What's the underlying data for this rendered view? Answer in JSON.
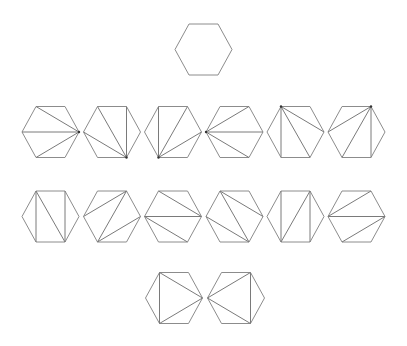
{
  "figure": {
    "stroke_color": "#8c8c8c",
    "diagonal_color": "#7a7a7a",
    "background": "#ffffff"
  },
  "hexagon_shape": {
    "half_width": 28.5,
    "top_half_width": 14.5,
    "half_height": 25.5,
    "vertex_order": [
      "TL",
      "TR",
      "R",
      "BR",
      "BL",
      "L"
    ]
  },
  "rows": [
    {
      "name": "original-hexagon",
      "y": 49.5,
      "hexagons": [
        {
          "x": 203.5,
          "diagonals": []
        }
      ]
    },
    {
      "name": "fan-triangulations",
      "y": 132,
      "hexagons": [
        {
          "x": 50.5,
          "apex": "R",
          "diagonals": [
            [
              "R",
              "TL"
            ],
            [
              "R",
              "L"
            ],
            [
              "R",
              "BL"
            ]
          ]
        },
        {
          "x": 112,
          "apex": "BR",
          "diagonals": [
            [
              "BR",
              "L"
            ],
            [
              "BR",
              "TL"
            ],
            [
              "BR",
              "TR"
            ]
          ]
        },
        {
          "x": 173,
          "apex": "BL",
          "diagonals": [
            [
              "BL",
              "TL"
            ],
            [
              "BL",
              "TR"
            ],
            [
              "BL",
              "R"
            ]
          ]
        },
        {
          "x": 234.5,
          "apex": "L",
          "diagonals": [
            [
              "L",
              "TR"
            ],
            [
              "L",
              "R"
            ],
            [
              "L",
              "BR"
            ]
          ]
        },
        {
          "x": 295.5,
          "apex": "TL",
          "diagonals": [
            [
              "TL",
              "R"
            ],
            [
              "TL",
              "BR"
            ],
            [
              "TL",
              "BL"
            ]
          ]
        },
        {
          "x": 356.5,
          "apex": "TR",
          "diagonals": [
            [
              "TR",
              "L"
            ],
            [
              "TR",
              "BL"
            ],
            [
              "TR",
              "BR"
            ]
          ]
        }
      ]
    },
    {
      "name": "zigzag-triangulations",
      "y": 216.5,
      "hexagons": [
        {
          "x": 50.5,
          "diagonals": [
            [
              "TL",
              "BL"
            ],
            [
              "TL",
              "BR"
            ],
            [
              "TR",
              "BR"
            ]
          ]
        },
        {
          "x": 112,
          "diagonals": [
            [
              "TR",
              "L"
            ],
            [
              "TR",
              "BL"
            ],
            [
              "BL",
              "R"
            ]
          ]
        },
        {
          "x": 173,
          "diagonals": [
            [
              "TL",
              "R"
            ],
            [
              "L",
              "R"
            ],
            [
              "L",
              "BR"
            ]
          ]
        },
        {
          "x": 234.5,
          "diagonals": [
            [
              "TL",
              "R"
            ],
            [
              "TL",
              "BR"
            ],
            [
              "L",
              "BR"
            ]
          ]
        },
        {
          "x": 295.5,
          "diagonals": [
            [
              "TL",
              "BL"
            ],
            [
              "TR",
              "BL"
            ],
            [
              "TR",
              "BR"
            ]
          ]
        },
        {
          "x": 356.5,
          "diagonals": [
            [
              "L",
              "TR"
            ],
            [
              "L",
              "R"
            ],
            [
              "R",
              "BL"
            ]
          ]
        }
      ]
    },
    {
      "name": "central-triangle-triangulations",
      "y": 298,
      "hexagons": [
        {
          "x": 174,
          "diagonals": [
            [
              "TL",
              "BL"
            ],
            [
              "TL",
              "R"
            ],
            [
              "BL",
              "R"
            ]
          ]
        },
        {
          "x": 236,
          "diagonals": [
            [
              "L",
              "TR"
            ],
            [
              "TR",
              "BR"
            ],
            [
              "L",
              "BR"
            ]
          ]
        }
      ]
    }
  ]
}
